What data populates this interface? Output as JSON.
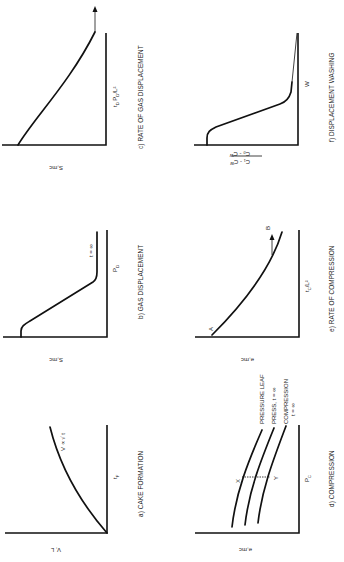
{
  "figure": {
    "orientation": "rotated 90 degrees counter-clockwise",
    "panels": [
      {
        "id": "a",
        "caption": "a)  CAKE FORMATION",
        "y_label": "V, L",
        "x_label": "t",
        "x_label_sub": "F",
        "annotation": "V ∝ √ t",
        "annotation_sub": "F"
      },
      {
        "id": "b",
        "caption": "b)  GAS DISPLACEMENT",
        "y_label": "S,mc",
        "x_label": "P",
        "x_label_sub": "D",
        "annotation": "t = ∞"
      },
      {
        "id": "c",
        "caption": "c)  RATE OF GAS DISPLACEMENT",
        "y_label": "S,mc",
        "x_label": "t",
        "x_label_sub": "D",
        "x_label_rest": " P",
        "x_label_sub2": "D",
        "x_label_tail": "/L²"
      },
      {
        "id": "d",
        "caption": "d)  COMPRESSION",
        "y_label": "e,mc",
        "x_label": "P",
        "x_label_sub": "C",
        "curve_labels": [
          "PRESSURE LEAF",
          "PRESS, t = ∞",
          "COMPRESSION"
        ],
        "curve_label_extra": "t = ∞",
        "point_labels": [
          "X",
          "Y"
        ]
      },
      {
        "id": "e",
        "caption": "e)  RATE OF COMPRESSION",
        "y_label": "e,mc",
        "x_label": "t",
        "x_label_sub": "C",
        "x_label_tail": "/L²",
        "point_labels": [
          "A",
          "B"
        ]
      },
      {
        "id": "f",
        "caption": "f)  DISPLACEMENT WASHING",
        "y_label_num": "C₁ - Cᵂ",
        "y_label_den": "C₀ - Cᵂ",
        "x_label": "W"
      }
    ]
  }
}
